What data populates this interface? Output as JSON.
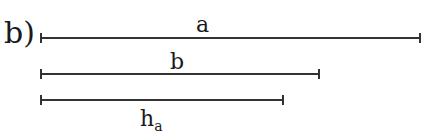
{
  "part_label": "b)",
  "segments": [
    {
      "name": "a",
      "label": "a",
      "subscript": "",
      "x1": 40,
      "x2": 420,
      "y": 38,
      "label_x": 196,
      "label_y": 14
    },
    {
      "name": "b",
      "label": "b",
      "subscript": "",
      "x1": 40,
      "x2": 319,
      "y": 74,
      "label_x": 170,
      "label_y": 52
    },
    {
      "name": "h_a",
      "label": "h",
      "subscript": "a",
      "x1": 40,
      "x2": 283,
      "y": 100,
      "label_x": 140,
      "label_y": 108
    }
  ]
}
